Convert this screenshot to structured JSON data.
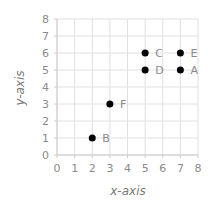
{
  "chart_data": {
    "type": "scatter",
    "title": "",
    "xlabel": "x-axis",
    "ylabel": "y-axis",
    "xlim": [
      0,
      8
    ],
    "ylim": [
      0,
      8
    ],
    "x_ticks": [
      "0",
      "1",
      "2",
      "3",
      "4",
      "5",
      "6",
      "7",
      "8"
    ],
    "y_ticks": [
      "0",
      "1",
      "2",
      "3",
      "4",
      "5",
      "6",
      "7",
      "8"
    ],
    "grid": true,
    "legend": null,
    "points": [
      {
        "label": "A",
        "x": 7,
        "y": 5
      },
      {
        "label": "B",
        "x": 2,
        "y": 1
      },
      {
        "label": "C",
        "x": 5,
        "y": 6
      },
      {
        "label": "D",
        "x": 5,
        "y": 5
      },
      {
        "label": "E",
        "x": 7,
        "y": 6
      },
      {
        "label": "F",
        "x": 3,
        "y": 3
      }
    ],
    "colors": {
      "point": "#000000",
      "grid": "#e0e0e0",
      "axis": "#cccccc",
      "text": "#8a8a8a"
    }
  }
}
